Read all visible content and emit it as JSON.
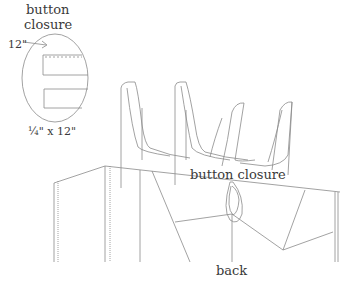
{
  "labels": {
    "detail_title_line1": "button",
    "detail_title_line2": "closure",
    "detail_measure_top": "12\"",
    "detail_measure_bottom": "¼\" x 12\"",
    "closure_label": "button closure",
    "view_label": "back"
  },
  "colors": {
    "line": "#8a8a8a",
    "text": "#3a3a3a",
    "background": "#ffffff"
  }
}
